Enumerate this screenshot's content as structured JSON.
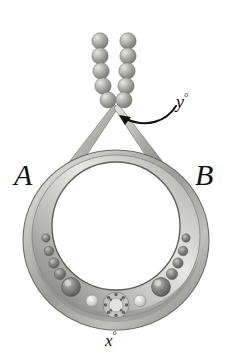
{
  "figure": {
    "name": "pendant-with-beaded-chain",
    "background_color": "#ffffff",
    "labels": {
      "left_vertex": "A",
      "right_vertex": "B",
      "apex_angle_text": "y",
      "bottom_angle_text": "x",
      "degree_symbol": "°"
    },
    "annotations": {
      "arrow": "curved-arrow-pointing-to-apex-angle"
    },
    "colors": {
      "metal_light": "#f2f2f0",
      "metal_mid": "#b9b9b6",
      "metal_dark": "#7d7d7a",
      "metal_shadow": "#5d5d5b",
      "bead_light": "#d8d8d4",
      "bead_dark": "#8a8a86",
      "gem_dark": "#6f6f6c",
      "gem_light": "#c9c9c5",
      "ink": "#111111"
    },
    "geometry": {
      "apex": [
        116,
        104
      ],
      "ring_center": [
        116,
        238
      ],
      "ring_outer_radius": 93,
      "ring_inner_radius": 62,
      "bead_count_per_strand": 5,
      "strand_count": 2,
      "left_gem_column_count": 4,
      "right_gem_column_count": 4,
      "large_gem_count": 2,
      "pale_gem_count": 2,
      "center_ornament": "rosette-cluster"
    }
  }
}
